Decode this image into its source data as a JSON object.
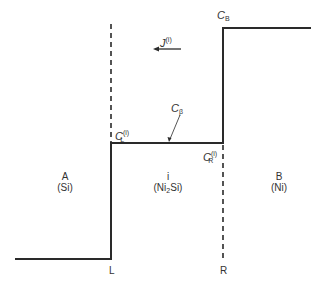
{
  "diagram": {
    "type": "concentration-profile",
    "regions": [
      {
        "id": "A",
        "name": "A",
        "material": "(Si)"
      },
      {
        "id": "i",
        "name": "i",
        "material_prefix": "(Ni",
        "material_sub": "2",
        "material_suffix": "Si)"
      },
      {
        "id": "B",
        "name": "B",
        "material": "(Ni)"
      }
    ],
    "labels": {
      "flux": {
        "base": "J",
        "sup": "(i)"
      },
      "c_beta": {
        "base": "C",
        "sub": "β"
      },
      "c_L": {
        "base": "C",
        "sup": "(i)",
        "sub": "L"
      },
      "c_R": {
        "base": "C",
        "sup": "(i)",
        "sub": "R"
      },
      "c_B": {
        "base": "C",
        "sub": "B"
      },
      "interface_left": "L",
      "interface_right": "R"
    },
    "colors": {
      "line": "#2a2a2a",
      "background": "#ffffff"
    }
  }
}
